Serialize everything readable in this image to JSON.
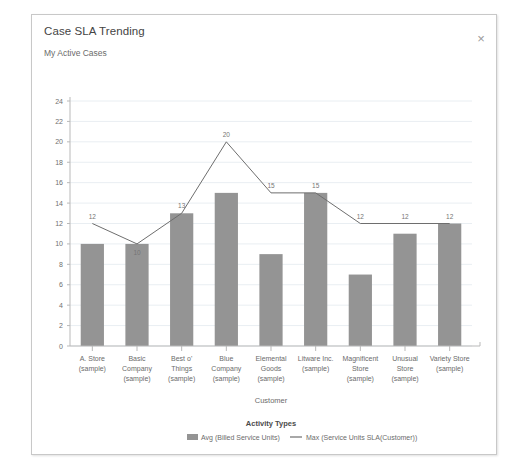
{
  "dialog": {
    "title": "Case SLA Trending",
    "subtitle": "My Active Cases",
    "close_label": "×",
    "close_icon": "close-icon"
  },
  "chart_data": {
    "type": "bar",
    "title": "",
    "xlabel": "Customer",
    "ylabel": "",
    "ylim": [
      0,
      24
    ],
    "ytick_step": 2,
    "yticks": [
      0,
      2,
      4,
      6,
      8,
      10,
      12,
      14,
      16,
      18,
      20,
      22,
      24
    ],
    "grid": true,
    "legend_position": "bottom",
    "legend_title": "Activity Types",
    "categories": [
      "A. Store (sample)",
      "Basic Company (sample)",
      "Best o' Things (sample)",
      "Blue Company (sample)",
      "Elemental Goods (sample)",
      "Litware Inc. (sample)",
      "Magnificent Store (sample)",
      "Unusual Store (sample)",
      "Variety Store (sample)"
    ],
    "categories_lines": [
      [
        "A. Store",
        "(sample)"
      ],
      [
        "Basic",
        "Company",
        "(sample)"
      ],
      [
        "Best o'",
        "Things",
        "(sample)"
      ],
      [
        "Blue",
        "Company",
        "(sample)"
      ],
      [
        "Elemental",
        "Goods",
        "(sample)"
      ],
      [
        "Litware Inc.",
        "(sample)"
      ],
      [
        "Magnificent",
        "Store",
        "(sample)"
      ],
      [
        "Unusual",
        "Store",
        "(sample)"
      ],
      [
        "Variety Store",
        "(sample)"
      ]
    ],
    "series": [
      {
        "name": "Avg (Billed Service Units)",
        "type": "bar",
        "color": "#949494",
        "values": [
          10,
          10,
          13,
          15,
          9,
          15,
          7,
          11,
          12
        ],
        "show_labels": false
      },
      {
        "name": "Max (Service Units SLA(Customer))",
        "type": "line",
        "color": "#6e6e6e",
        "values": [
          12,
          10,
          13,
          20,
          15,
          15,
          12,
          12,
          12
        ],
        "show_labels": true,
        "labels": [
          "12",
          "10",
          "13",
          "20",
          "15",
          "15",
          "12",
          "12",
          "12"
        ]
      }
    ]
  },
  "colors": {
    "bar": "#949494",
    "line": "#6e6e6e",
    "grid": "#e9eef2",
    "axis": "#b9b9b9",
    "dialog_border": "#c8c8c8"
  }
}
